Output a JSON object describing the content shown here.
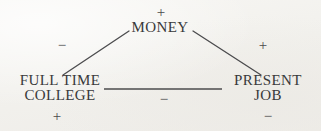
{
  "diagram": {
    "type": "causal-loop-diagram",
    "background_color": "#f4f3f0",
    "ink_color": "#39393a",
    "nodes": [
      {
        "id": "money",
        "label_lines": [
          "MONEY"
        ],
        "line1": "MONEY",
        "polarity_marker": "+",
        "polarity_position": "above"
      },
      {
        "id": "full-time-college",
        "label_lines": [
          "FULL TIME",
          "COLLEGE"
        ],
        "line1": "FULL TIME",
        "line2": "COLLEGE",
        "polarity_marker": "+",
        "polarity_position": "below"
      },
      {
        "id": "present-job",
        "label_lines": [
          "PRESENT",
          "JOB"
        ],
        "line1": "PRESENT",
        "line2": "JOB",
        "polarity_marker": "−",
        "polarity_position": "below"
      }
    ],
    "edges": [
      {
        "id": "college-money",
        "from": "full-time-college",
        "to": "money",
        "sign": "−",
        "x1": 63,
        "y1": 75,
        "x2": 129,
        "y2": 31
      },
      {
        "id": "money-job",
        "from": "money",
        "to": "present-job",
        "sign": "+",
        "x1": 193,
        "y1": 31,
        "x2": 261,
        "y2": 75
      },
      {
        "id": "college-job",
        "from": "full-time-college",
        "to": "present-job",
        "sign": "−",
        "x1": 104,
        "y1": 89,
        "x2": 222,
        "y2": 89
      }
    ],
    "signs": {
      "money_top": "+",
      "left_edge": "−",
      "right_edge": "+",
      "middle_edge": "−",
      "college_bottom": "+",
      "job_bottom": "−"
    }
  }
}
